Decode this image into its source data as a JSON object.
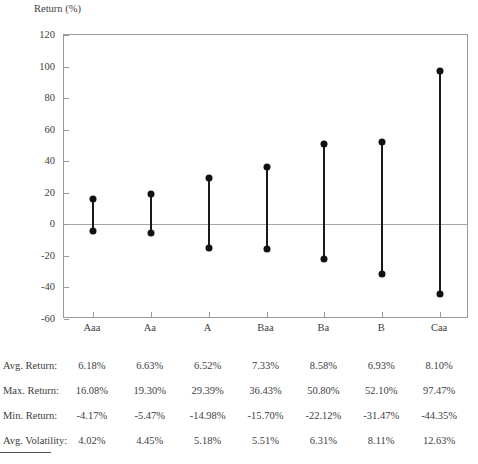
{
  "chart_data": {
    "type": "line",
    "title": "",
    "ylabel": "Return (%)",
    "xlabel": "",
    "grid": false,
    "legend": "none",
    "ylim": [
      -60,
      120
    ],
    "ytick_step": 20,
    "yticks": [
      "120",
      "100",
      "80",
      "60",
      "40",
      "20",
      "0",
      "-20",
      "-40",
      "-60"
    ],
    "ytick_values": [
      120,
      100,
      80,
      60,
      40,
      20,
      0,
      -20,
      -40,
      -60
    ],
    "categories": [
      "Aaa",
      "Aa",
      "A",
      "Baa",
      "Ba",
      "B",
      "Caa"
    ],
    "series": [
      {
        "name": "Max. Return",
        "values": [
          16.08,
          19.3,
          29.39,
          36.43,
          50.8,
          52.1,
          97.47
        ]
      },
      {
        "name": "Min. Return",
        "values": [
          -4.17,
          -5.47,
          -14.98,
          -15.7,
          -22.12,
          -31.47,
          -44.35
        ]
      }
    ],
    "annotations": [
      "Vertical stems connect each rating's minimum and maximum return."
    ]
  },
  "axis": {
    "y_title": "Return (%)"
  },
  "table": {
    "columns": [
      "Aaa",
      "Aa",
      "A",
      "Baa",
      "Ba",
      "B",
      "Caa"
    ],
    "rows": [
      {
        "label": "Avg. Return:",
        "values": [
          "6.18%",
          "6.63%",
          "6.52%",
          "7.33%",
          "8.58%",
          "6.93%",
          "8.10%"
        ]
      },
      {
        "label": "Max. Return:",
        "values": [
          "16.08%",
          "19.30%",
          "29.39%",
          "36.43%",
          "50.80%",
          "52.10%",
          "97.47%"
        ]
      },
      {
        "label": "Min. Return:",
        "values": [
          "-4.17%",
          "-5.47%",
          "-14.98%",
          "-15.70%",
          "-22.12%",
          "-31.47%",
          "-44.35%"
        ]
      },
      {
        "label": "Avg. Volatility:",
        "values": [
          "4.02%",
          "4.45%",
          "5.18%",
          "5.51%",
          "6.31%",
          "8.11%",
          "12.63%"
        ]
      }
    ]
  },
  "colors": {
    "marker": "#111111",
    "frame": "#9a9a9a",
    "text": "#3d3d3d",
    "zero_line": "#a6a6a6"
  }
}
